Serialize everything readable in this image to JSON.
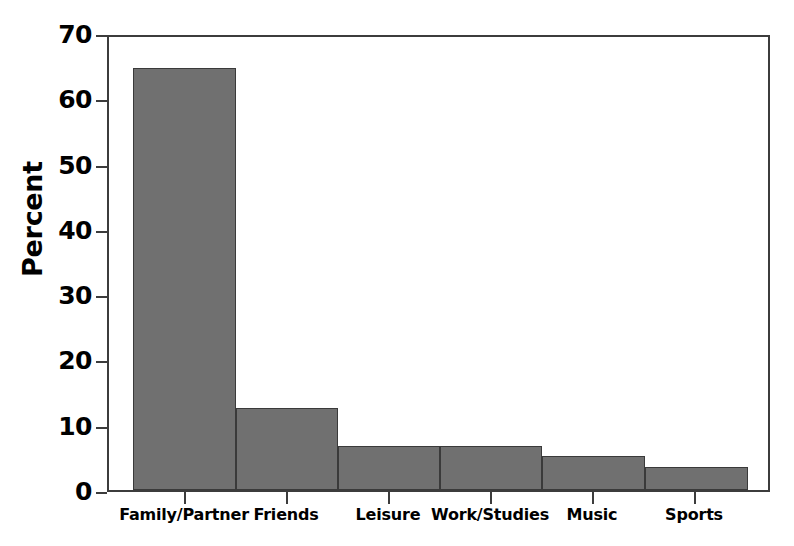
{
  "chart_data": {
    "type": "bar",
    "title": "",
    "xlabel": "",
    "ylabel": "Percent",
    "categories": [
      "Family/Partner",
      "Friends",
      "Leisure",
      "Work/Studies",
      "Music",
      "Sports"
    ],
    "values": [
      65.2,
      12.6,
      6.8,
      6.8,
      5.2,
      3.5
    ],
    "ylim": [
      0,
      70
    ],
    "ytick_labels": [
      "0",
      "10",
      "20",
      "30",
      "40",
      "50",
      "60",
      "70"
    ],
    "ytick_values": [
      0,
      10,
      20,
      30,
      40,
      50,
      60,
      70
    ],
    "grid": false,
    "legend": false,
    "legend_position": "none",
    "bar_style": "adjacent",
    "colors": {
      "bar_fill": "#707070",
      "bar_edge": "#3a3a3a",
      "axis": "#3c3c3c",
      "text": "#000000",
      "background": "#ffffff"
    }
  }
}
